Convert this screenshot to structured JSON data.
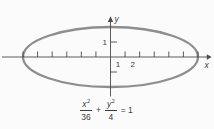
{
  "figure": {
    "x_axis_label": "x",
    "y_axis_label": "y",
    "x_tick_labels": [
      {
        "value": 1,
        "label": "1"
      },
      {
        "value": 2,
        "label": "2"
      }
    ],
    "y_tick_labels": [
      {
        "value": 1,
        "label": "1"
      }
    ],
    "equation": {
      "numerator_1": "x",
      "exponent_1": "2",
      "denominator_1": "36",
      "plus": "+",
      "numerator_2": "y",
      "exponent_2": "2",
      "denominator_2": "4",
      "equals_rhs": "= 1"
    }
  },
  "chart_data": {
    "type": "line",
    "curve": "ellipse",
    "equation_text": "x^2/36 + y^2/4 = 1",
    "center": [
      0,
      0
    ],
    "semi_axis_x": 6,
    "semi_axis_y": 2,
    "x_vertices": [
      [
        -6,
        0
      ],
      [
        6,
        0
      ]
    ],
    "y_vertices": [
      [
        0,
        -2
      ],
      [
        0,
        2
      ]
    ],
    "x_ticks": [
      -6,
      -5,
      -4,
      -3,
      -2,
      -1,
      1,
      2,
      3,
      4,
      5,
      6
    ],
    "y_ticks": [
      -1,
      1
    ],
    "labeled_x_ticks": [
      1,
      2
    ],
    "labeled_y_ticks": [
      1
    ],
    "xlabel": "x",
    "ylabel": "y",
    "xlim": [
      -7.4,
      7.1
    ],
    "ylim": [
      -2.7,
      2.8
    ],
    "grid": false,
    "colors": {
      "ellipse_stroke": "#8e8e8e",
      "axis": "#4a4a4a",
      "text": "#3b3b3b",
      "background": "#fbfbfb"
    }
  }
}
